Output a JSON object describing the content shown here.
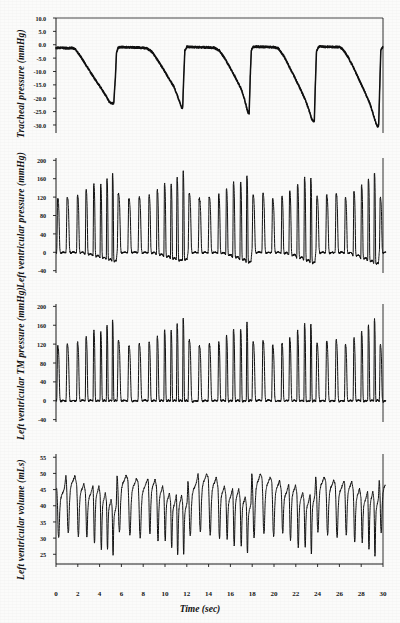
{
  "figure": {
    "x_axis_label": "Time (sec)",
    "x_ticks": [
      "0",
      "2",
      "4",
      "6",
      "8",
      "10",
      "12",
      "14",
      "16",
      "18",
      "20",
      "22",
      "24",
      "26",
      "28",
      "30"
    ],
    "x_tick_values": [
      0,
      2,
      4,
      6,
      8,
      10,
      12,
      14,
      16,
      18,
      20,
      22,
      24,
      26,
      28,
      30
    ],
    "xlim": [
      0,
      30
    ],
    "trace_color": "#111111",
    "axis_color": "#1a1a1a",
    "background_color": "#fbfbfa"
  },
  "panels": [
    {
      "id": "tracheal-pressure",
      "ylabel": "Tracheal pressure (mmHg)",
      "y_ticks": [
        "10.0",
        "5.0",
        "0.0",
        "-5.0",
        "-10.0",
        "-15.0",
        "-20.0",
        "-25.0",
        "-30.0"
      ],
      "y_tick_values": [
        10,
        5,
        0,
        -5,
        -10,
        -15,
        -20,
        -25,
        -30
      ],
      "ylim": [
        -33,
        10
      ]
    },
    {
      "id": "left-ventricular-pressure",
      "ylabel": "Left ventricular pressure (mmHg)",
      "y_ticks": [
        "200",
        "160",
        "120",
        "80",
        "40",
        "0",
        "-40"
      ],
      "y_tick_values": [
        200,
        160,
        120,
        80,
        40,
        0,
        -40
      ],
      "ylim": [
        -45,
        205
      ]
    },
    {
      "id": "left-ventricular-tm-pressure",
      "ylabel": "Left ventricular TM pressure (mmHg)",
      "y_ticks": [
        "200",
        "160",
        "120",
        "80",
        "40",
        "0",
        "-40"
      ],
      "y_tick_values": [
        200,
        160,
        120,
        80,
        40,
        0,
        -40
      ],
      "ylim": [
        -45,
        205
      ]
    },
    {
      "id": "left-ventricular-volume",
      "ylabel": "Left ventricular volume (mLs)",
      "y_ticks": [
        "55",
        "50",
        "45",
        "40",
        "35",
        "30",
        "25"
      ],
      "y_tick_values": [
        55,
        50,
        45,
        40,
        35,
        30,
        25
      ],
      "ylim": [
        22,
        56
      ]
    }
  ],
  "chart_data": {
    "type": "line",
    "xlabel": "Time (sec)",
    "xlim": [
      0,
      30
    ],
    "grid": false,
    "legend": "none",
    "subplots": [
      {
        "name": "Tracheal pressure",
        "ylabel": "Tracheal pressure (mmHg)",
        "ylim": [
          -33,
          10
        ],
        "yticks": [
          10,
          5,
          0,
          -5,
          -10,
          -15,
          -20,
          -25,
          -30
        ],
        "description": "Five repeated Mueller maneuvers. Baseline plateau near -1 mmHg, gradual fall to a negative nadir, then abrupt return to baseline.",
        "events": [
          {
            "start": 0.0,
            "plateau_end": 1.6,
            "nadir_time": 5.0,
            "nadir": -22.0,
            "release_end": 5.5
          },
          {
            "start": 5.5,
            "plateau_end": 8.2,
            "nadir_time": 11.3,
            "nadir": -23.5,
            "release_end": 11.7
          },
          {
            "start": 11.7,
            "plateau_end": 14.6,
            "nadir_time": 17.3,
            "nadir": -25.5,
            "release_end": 17.7
          },
          {
            "start": 17.7,
            "plateau_end": 20.3,
            "nadir_time": 23.3,
            "nadir": -28.5,
            "release_end": 23.7
          },
          {
            "start": 23.7,
            "plateau_end": 26.0,
            "nadir_time": 29.3,
            "nadir": -30.5,
            "release_end": 29.6
          }
        ],
        "points": [
          [
            0.0,
            -1.2
          ],
          [
            0.5,
            -1.1
          ],
          [
            1.0,
            -1.3
          ],
          [
            1.5,
            -1.2
          ],
          [
            1.8,
            -1.8
          ],
          [
            2.2,
            -4.0
          ],
          [
            2.6,
            -6.6
          ],
          [
            3.0,
            -9.2
          ],
          [
            3.4,
            -11.8
          ],
          [
            3.8,
            -14.2
          ],
          [
            4.2,
            -16.6
          ],
          [
            4.6,
            -19.2
          ],
          [
            4.9,
            -21.4
          ],
          [
            5.1,
            -22.0
          ],
          [
            5.3,
            -21.8
          ],
          [
            5.45,
            -12.0
          ],
          [
            5.55,
            -3.0
          ],
          [
            5.7,
            -1.0
          ],
          [
            6.2,
            -0.9
          ],
          [
            7.0,
            -1.0
          ],
          [
            7.8,
            -1.1
          ],
          [
            8.3,
            -1.3
          ],
          [
            8.8,
            -2.6
          ],
          [
            9.3,
            -5.6
          ],
          [
            9.8,
            -8.8
          ],
          [
            10.3,
            -12.2
          ],
          [
            10.8,
            -15.6
          ],
          [
            11.1,
            -18.6
          ],
          [
            11.35,
            -21.4
          ],
          [
            11.5,
            -23.4
          ],
          [
            11.62,
            -23.6
          ],
          [
            11.72,
            -12.0
          ],
          [
            11.82,
            -2.2
          ],
          [
            12.0,
            -0.8
          ],
          [
            12.8,
            -0.9
          ],
          [
            13.8,
            -1.0
          ],
          [
            14.5,
            -1.1
          ],
          [
            15.0,
            -2.2
          ],
          [
            15.5,
            -5.2
          ],
          [
            16.0,
            -8.8
          ],
          [
            16.5,
            -12.6
          ],
          [
            17.0,
            -16.6
          ],
          [
            17.3,
            -20.4
          ],
          [
            17.5,
            -23.8
          ],
          [
            17.62,
            -25.4
          ],
          [
            17.72,
            -25.6
          ],
          [
            17.82,
            -12.0
          ],
          [
            17.92,
            -2.0
          ],
          [
            18.1,
            -0.7
          ],
          [
            19.0,
            -0.8
          ],
          [
            20.0,
            -0.9
          ],
          [
            20.4,
            -1.4
          ],
          [
            20.9,
            -4.2
          ],
          [
            21.4,
            -8.2
          ],
          [
            21.9,
            -12.2
          ],
          [
            22.4,
            -16.4
          ],
          [
            22.9,
            -20.8
          ],
          [
            23.2,
            -24.4
          ],
          [
            23.45,
            -27.6
          ],
          [
            23.6,
            -28.6
          ],
          [
            23.7,
            -28.4
          ],
          [
            23.8,
            -14.0
          ],
          [
            23.9,
            -2.4
          ],
          [
            24.1,
            -0.7
          ],
          [
            25.0,
            -0.8
          ],
          [
            26.0,
            -0.9
          ],
          [
            26.3,
            -1.6
          ],
          [
            26.8,
            -4.6
          ],
          [
            27.3,
            -8.6
          ],
          [
            27.8,
            -13.0
          ],
          [
            28.3,
            -17.4
          ],
          [
            28.8,
            -22.0
          ],
          [
            29.1,
            -26.0
          ],
          [
            29.35,
            -29.4
          ],
          [
            29.5,
            -30.5
          ],
          [
            29.6,
            -30.2
          ],
          [
            29.7,
            -16.0
          ],
          [
            29.8,
            -2.0
          ],
          [
            30.0,
            -0.6
          ]
        ]
      },
      {
        "name": "Left ventricular pressure",
        "ylabel": "Left ventricular pressure (mmHg)",
        "ylim": [
          -45,
          205
        ],
        "yticks": [
          200,
          160,
          120,
          80,
          40,
          0,
          -40
        ],
        "description": "Beat-by-beat LV pressure. Systolic peaks 115-175 mmHg; end-diastolic baseline falls below zero during each Mueller maneuver (down to about -30 mmHg) and returns toward 0 after release.",
        "systolic_peaks": [
          128,
          130,
          132,
          140,
          150,
          160,
          170,
          175,
          138,
          122,
          124,
          126,
          128,
          136,
          148,
          158,
          162,
          130,
          134,
          140,
          150,
          160,
          164,
          168,
          126,
          132,
          146,
          152,
          158,
          168,
          172,
          140,
          128,
          130,
          160,
          150,
          126
        ],
        "diastolic_baseline": [
          0,
          0,
          -2,
          -6,
          -12,
          -18,
          -24,
          -28,
          0,
          0,
          -1,
          -3,
          -8,
          -14,
          -20,
          -26,
          -30,
          0,
          -1,
          -4,
          -9,
          -16,
          -22,
          -28,
          0,
          -2,
          -6,
          -12,
          -18,
          -25,
          -30,
          0,
          0,
          -2,
          -20,
          -10,
          0
        ],
        "beat_interval_sec": 0.78
      },
      {
        "name": "Left ventricular TM pressure",
        "ylabel": "Left ventricular TM pressure (mmHg)",
        "ylim": [
          -45,
          205
        ],
        "yticks": [
          200,
          160,
          120,
          80,
          40,
          0,
          -40
        ],
        "description": "Transmural LV pressure (LV pressure minus tracheal pressure). Systolic peaks 120-180 mmHg; diastolic baseline remains near 0 mmHg throughout, unlike the raw LV pressure trace.",
        "systolic_peaks": [
          128,
          126,
          130,
          138,
          148,
          158,
          170,
          178,
          132,
          122,
          124,
          126,
          130,
          140,
          152,
          162,
          166,
          128,
          132,
          138,
          148,
          158,
          164,
          168,
          124,
          130,
          144,
          154,
          162,
          170,
          174,
          138,
          126,
          128,
          160,
          152,
          124
        ],
        "diastolic_baseline": [
          0,
          0,
          0,
          0,
          0,
          0,
          0,
          0,
          0,
          0,
          0,
          0,
          0,
          0,
          0,
          0,
          0,
          0,
          0,
          0,
          0,
          0,
          0,
          0,
          0,
          0,
          0,
          0,
          0,
          0,
          0,
          0,
          0,
          0,
          0,
          0,
          0
        ],
        "beat_interval_sec": 0.78
      },
      {
        "name": "Left ventricular volume",
        "ylabel": "Left ventricular volume (mLs)",
        "ylim": [
          22,
          56
        ],
        "yticks": [
          55,
          50,
          45,
          40,
          35,
          30,
          25
        ],
        "description": "Beat-by-beat LV volume oscillating between end-diastolic maxima (about 42-50 mL) and end-systolic minima (about 24-30 mL). End-diastolic volume falls progressively during each Mueller maneuver and recovers with a transient overshoot after release.",
        "end_diastolic": [
          41,
          43,
          45,
          46,
          47,
          47,
          48,
          50,
          44,
          43,
          42,
          44,
          45,
          46,
          46,
          48,
          49,
          43,
          42,
          44,
          45,
          47,
          47,
          48,
          43,
          44,
          45,
          46,
          47,
          48,
          50,
          45,
          43,
          44,
          49,
          46,
          43
        ],
        "end_systolic": [
          31,
          29,
          28,
          27,
          26,
          25,
          25,
          24,
          33,
          31,
          30,
          29,
          28,
          27,
          26,
          25,
          24,
          33,
          31,
          29,
          28,
          27,
          26,
          25,
          32,
          30,
          29,
          27,
          26,
          25,
          24,
          32,
          31,
          30,
          26,
          28,
          33
        ],
        "beat_interval_sec": 0.78
      }
    ]
  }
}
